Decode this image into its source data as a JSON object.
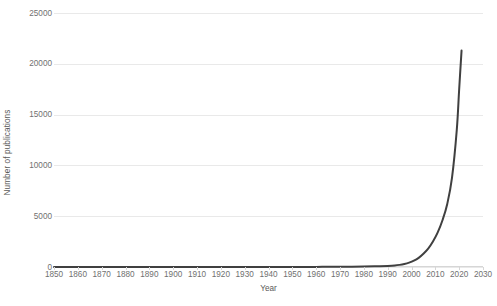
{
  "chart_data": {
    "type": "line",
    "title": "",
    "xlabel": "Year",
    "ylabel": "Number of publications",
    "xlim": [
      1850,
      2030
    ],
    "ylim": [
      0,
      25000
    ],
    "grid": true,
    "legend": false,
    "series_color": "#404040",
    "gridline_color": "#e9e9e9",
    "background_color": "#ffffff",
    "x_ticks": [
      1850,
      1860,
      1870,
      1880,
      1890,
      1900,
      1910,
      1920,
      1930,
      1940,
      1950,
      1960,
      1970,
      1980,
      1990,
      2000,
      2010,
      2020,
      2030
    ],
    "y_ticks": [
      0,
      5000,
      10000,
      15000,
      20000,
      25000
    ],
    "series": [
      {
        "name": "Number of publications",
        "x": [
          1850,
          1860,
          1870,
          1880,
          1890,
          1900,
          1910,
          1920,
          1930,
          1940,
          1950,
          1955,
          1960,
          1965,
          1970,
          1975,
          1980,
          1985,
          1990,
          1993,
          1995,
          1997,
          1999,
          2001,
          2003,
          2005,
          2007,
          2009,
          2011,
          2013,
          2015,
          2017,
          2019,
          2020,
          2021
        ],
        "values": [
          0,
          0,
          0,
          0,
          0,
          0,
          0,
          0,
          0,
          0,
          5,
          8,
          12,
          18,
          25,
          35,
          50,
          70,
          110,
          150,
          210,
          300,
          430,
          620,
          900,
          1300,
          1800,
          2500,
          3400,
          4600,
          6200,
          8800,
          13500,
          17500,
          21300
        ]
      }
    ],
    "peak": {
      "year": 2021,
      "value": 21300
    }
  },
  "axis": {
    "y_title": "Number of publications",
    "x_title": "Year",
    "y_tick_labels": [
      "25000",
      "20000",
      "15000",
      "10000",
      "5000",
      "0"
    ],
    "x_tick_labels": [
      "1850",
      "1860",
      "1870",
      "1880",
      "1890",
      "1900",
      "1910",
      "1920",
      "1930",
      "1940",
      "1950",
      "1960",
      "1970",
      "1980",
      "1990",
      "2000",
      "2010",
      "2020",
      "2030"
    ]
  },
  "caption": {
    "text": ""
  }
}
